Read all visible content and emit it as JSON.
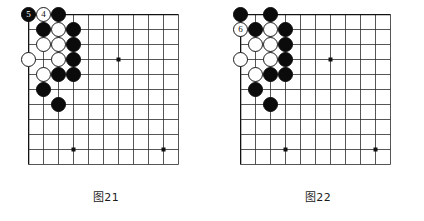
{
  "page": {
    "background_color": "#ffffff"
  },
  "board_spec": {
    "columns": 11,
    "rows": 11,
    "cell_size": 15,
    "line_color": "#2b2b2b",
    "edge_line_color": "#111111",
    "star_points": [
      {
        "col": 6,
        "row": 3
      },
      {
        "col": 3,
        "row": 9
      },
      {
        "col": 9,
        "row": 9
      }
    ],
    "black_color": "#0b0b0b",
    "white_color": "#ffffff"
  },
  "figures": [
    {
      "id": "figure-21",
      "caption": "图21",
      "stones": [
        {
          "col": 0,
          "row": 0,
          "color": "black",
          "label": "5"
        },
        {
          "col": 1,
          "row": 0,
          "color": "white",
          "label": "4"
        },
        {
          "col": 2,
          "row": 0,
          "color": "black",
          "label": ""
        },
        {
          "col": 1,
          "row": 1,
          "color": "black",
          "label": ""
        },
        {
          "col": 2,
          "row": 1,
          "color": "white",
          "label": ""
        },
        {
          "col": 3,
          "row": 1,
          "color": "black",
          "label": ""
        },
        {
          "col": 1,
          "row": 2,
          "color": "white",
          "label": ""
        },
        {
          "col": 2,
          "row": 2,
          "color": "white",
          "label": ""
        },
        {
          "col": 3,
          "row": 2,
          "color": "black",
          "label": ""
        },
        {
          "col": 0,
          "row": 3,
          "color": "white",
          "label": ""
        },
        {
          "col": 2,
          "row": 3,
          "color": "white",
          "label": ""
        },
        {
          "col": 3,
          "row": 3,
          "color": "black",
          "label": ""
        },
        {
          "col": 1,
          "row": 4,
          "color": "white",
          "label": ""
        },
        {
          "col": 2,
          "row": 4,
          "color": "black",
          "label": ""
        },
        {
          "col": 3,
          "row": 4,
          "color": "black",
          "label": ""
        },
        {
          "col": 1,
          "row": 5,
          "color": "black",
          "label": ""
        },
        {
          "col": 2,
          "row": 6,
          "color": "black",
          "label": ""
        }
      ]
    },
    {
      "id": "figure-22",
      "caption": "图22",
      "stones": [
        {
          "col": 0,
          "row": 0,
          "color": "black",
          "label": ""
        },
        {
          "col": 2,
          "row": 0,
          "color": "black",
          "label": ""
        },
        {
          "col": 0,
          "row": 1,
          "color": "white",
          "label": "6"
        },
        {
          "col": 1,
          "row": 1,
          "color": "black",
          "label": ""
        },
        {
          "col": 2,
          "row": 1,
          "color": "white",
          "label": ""
        },
        {
          "col": 3,
          "row": 1,
          "color": "black",
          "label": ""
        },
        {
          "col": 1,
          "row": 2,
          "color": "white",
          "label": ""
        },
        {
          "col": 2,
          "row": 2,
          "color": "white",
          "label": ""
        },
        {
          "col": 3,
          "row": 2,
          "color": "black",
          "label": ""
        },
        {
          "col": 0,
          "row": 3,
          "color": "white",
          "label": ""
        },
        {
          "col": 2,
          "row": 3,
          "color": "white",
          "label": ""
        },
        {
          "col": 3,
          "row": 3,
          "color": "black",
          "label": ""
        },
        {
          "col": 1,
          "row": 4,
          "color": "white",
          "label": ""
        },
        {
          "col": 2,
          "row": 4,
          "color": "black",
          "label": ""
        },
        {
          "col": 3,
          "row": 4,
          "color": "black",
          "label": ""
        },
        {
          "col": 1,
          "row": 5,
          "color": "black",
          "label": ""
        },
        {
          "col": 2,
          "row": 6,
          "color": "black",
          "label": ""
        }
      ]
    }
  ]
}
